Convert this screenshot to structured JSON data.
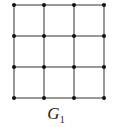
{
  "graph": {
    "name": "G",
    "subscript": "1",
    "rows": 4,
    "cols": 4,
    "x": [
      14,
      44,
      74,
      104
    ],
    "y": [
      5,
      36,
      67,
      98
    ],
    "edge_color": "#555555",
    "node_color": "#111111"
  }
}
